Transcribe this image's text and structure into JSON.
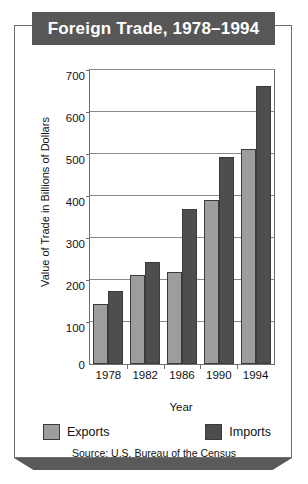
{
  "title": "Foreign Trade, 1978–1994",
  "source": "Source:  U.S. Bureau of the Census",
  "legend": {
    "exports_label": "Exports",
    "imports_label": "Imports"
  },
  "colors": {
    "exports": "#9d9d9d",
    "imports": "#4e4e4e",
    "title_banner": "#575757",
    "frame": "#6f6f6f",
    "base_shadow": "#5a5a5a"
  },
  "chart_data": {
    "type": "bar",
    "title": "Foreign Trade, 1978–1994",
    "xlabel": "Year",
    "ylabel": "Value of Trade in Billions of Dollars",
    "categories": [
      "1978",
      "1982",
      "1986",
      "1990",
      "1994"
    ],
    "series": [
      {
        "name": "Exports",
        "color": "#9d9d9d",
        "values": [
          143,
          212,
          218,
          390,
          513
        ]
      },
      {
        "name": "Imports",
        "color": "#4e4e4e",
        "values": [
          175,
          244,
          370,
          492,
          663
        ]
      }
    ],
    "ylim": [
      0,
      700
    ],
    "yticks": [
      0,
      100,
      200,
      300,
      400,
      500,
      600,
      700
    ],
    "ytick_labels": [
      "0",
      "100",
      "200",
      "300",
      "400",
      "500",
      "600",
      "700"
    ],
    "grid": true,
    "legend_position": "bottom"
  }
}
